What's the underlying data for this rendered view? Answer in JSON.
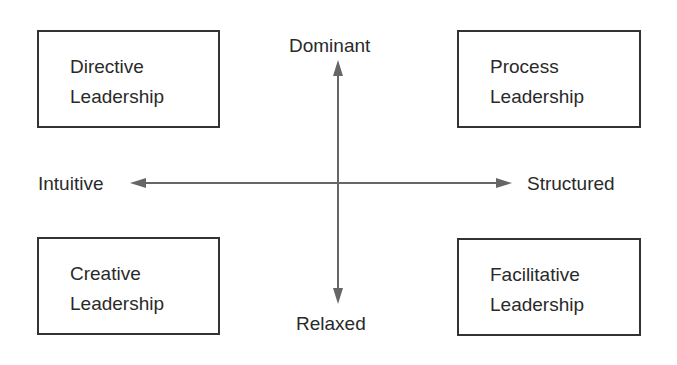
{
  "diagram": {
    "type": "quadrant",
    "axes": {
      "vertical": {
        "top": "Dominant",
        "bottom": "Relaxed"
      },
      "horizontal": {
        "left": "Intuitive",
        "right": "Structured"
      }
    },
    "quadrants": {
      "top_left": {
        "line1": "Directive",
        "line2": "Leadership"
      },
      "top_right": {
        "line1": "Process",
        "line2": "Leadership"
      },
      "bottom_left": {
        "line1": "Creative",
        "line2": "Leadership"
      },
      "bottom_right": {
        "line1": "Facilitative",
        "line2": "Leadership"
      }
    },
    "colors": {
      "line": "#666666",
      "box_border": "#333333",
      "text": "#2a2a2a"
    }
  }
}
